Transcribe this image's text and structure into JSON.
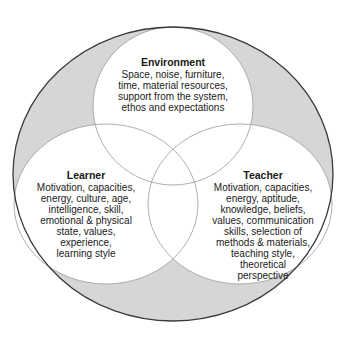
{
  "diagram": {
    "type": "venn",
    "colors": {
      "background": "#ffffff",
      "outer_fill": "#d6d6d6",
      "inner_fill": "#ffffff",
      "outer_stroke": "#3a3a3a",
      "inner_stroke": "#9a9a9a",
      "text": "#1a1a1a"
    },
    "sets": [
      {
        "id": "environment",
        "title": "Environment",
        "lines": [
          "Space, noise, furniture,",
          "time, material resources,",
          "support from the system,",
          "ethos and expectations"
        ]
      },
      {
        "id": "learner",
        "title": "Learner",
        "lines": [
          "Motivation, capacities,",
          "energy, culture, age,",
          "intelligence, skill,",
          "emotional & physical",
          "state, values,",
          "experience,",
          "learning style"
        ]
      },
      {
        "id": "teacher",
        "title": "Teacher",
        "lines": [
          "Motivation, capacities,",
          "energy, aptitude,",
          "knowledge, beliefs,",
          "values, communication",
          "skills, selection of",
          "methods & materials,",
          "teaching style,",
          "theoretical",
          "perspective"
        ]
      }
    ]
  }
}
